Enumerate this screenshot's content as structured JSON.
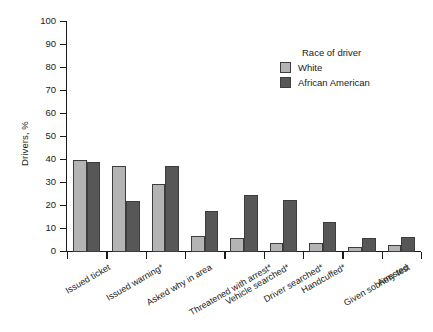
{
  "chart_data": {
    "type": "bar",
    "title": "",
    "xlabel": "",
    "ylabel": "Drivers, %",
    "ylim": [
      0,
      100
    ],
    "yticks": [
      0,
      10,
      20,
      30,
      40,
      50,
      60,
      70,
      80,
      90,
      100
    ],
    "grid": false,
    "legend_position": "upper right",
    "legend_title": "Race of driver",
    "categories": [
      "Issued ticket",
      "Issued warning*",
      "Asked why in area",
      "Threatened with arrest*",
      "Vehicle searched*",
      "Driver searched*",
      "Handcuffed*",
      "Given sobriety test",
      "Arrested"
    ],
    "series": [
      {
        "name": "White",
        "color": "#b4b4b4",
        "values": [
          40,
          37.5,
          29.5,
          7,
          6,
          4,
          4,
          2,
          3
        ]
      },
      {
        "name": "African American",
        "color": "#575757",
        "values": [
          39,
          22,
          37.5,
          18,
          25,
          22.5,
          13,
          6,
          6.5
        ]
      }
    ]
  },
  "legend": {
    "title": "Race of driver",
    "entries": [
      {
        "label": "White",
        "color": "#b4b4b4"
      },
      {
        "label": "African American",
        "color": "#575757"
      }
    ]
  },
  "axes": {
    "y_title": "Drivers, %",
    "y_tick_labels": [
      "100",
      "90",
      "80",
      "70",
      "60",
      "50",
      "40",
      "30",
      "20",
      "10",
      "0"
    ],
    "x_tick_labels": [
      "Issued ticket",
      "Issued warning*",
      "Asked why in area",
      "Threatened with arrest*",
      "Vehicle searched*",
      "Driver searched*",
      "Handcuffed*",
      "Given sobriety test",
      "Arrested"
    ]
  },
  "colors": {
    "white_series": "#b4b4b4",
    "african_american_series": "#575757",
    "axis": "#1a1a1a",
    "bar_border": "#3d3d3d",
    "background": "#ffffff"
  }
}
